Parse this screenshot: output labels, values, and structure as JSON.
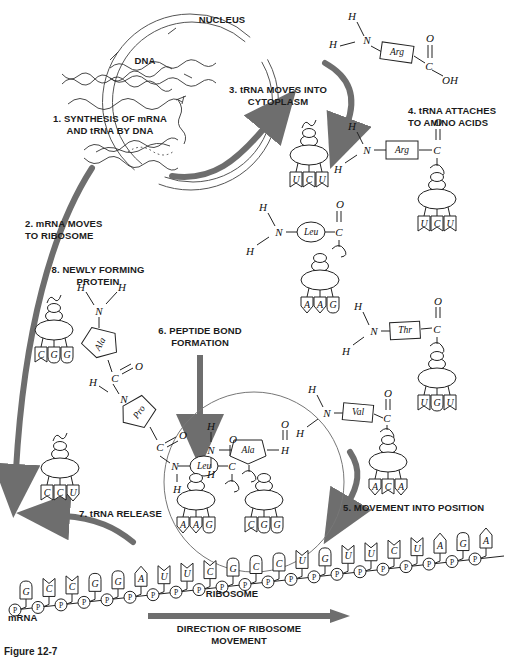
{
  "figure": {
    "caption": "Figure 12-7",
    "title_nucleus": "NUCLEUS",
    "label_dna": "DNA",
    "label_ribosome": "RIBOSOME",
    "label_mrna": "mRNA"
  },
  "steps": [
    {
      "id": 1,
      "text": "1. SYNTHESIS OF mRNA\nAND tRNA BY DNA"
    },
    {
      "id": 2,
      "text": "2. mRNA MOVES\nTO RIBOSOME"
    },
    {
      "id": 3,
      "text": "3. tRNA MOVES INTO\nCYTOPLASM"
    },
    {
      "id": 4,
      "text": "4. tRNA ATTACHES\nTO AMINO ACIDS"
    },
    {
      "id": 5,
      "text": "5. MOVEMENT INTO POSITION"
    },
    {
      "id": 6,
      "text": "6. PEPTIDE BOND\nFORMATION"
    },
    {
      "id": 7,
      "text": "7. tRNA RELEASE"
    },
    {
      "id": 8,
      "text": "8. NEWLY FORMING\nPROTEIN"
    }
  ],
  "direction_label": "DIRECTION OF RIBOSOME\nMOVEMENT",
  "amino_acids": {
    "arg": "Arg",
    "leu": "Leu",
    "thr": "Thr",
    "val": "Val",
    "ala": "Ala",
    "pro": "Pro"
  },
  "atoms": {
    "h": "H",
    "n": "N",
    "c": "C",
    "o": "O",
    "oh": "OH",
    "p": "P"
  },
  "trna_anticodons": {
    "free_cytoplasm": [
      "U",
      "C",
      "U"
    ],
    "arg_charged": [
      "U",
      "C",
      "U"
    ],
    "leu_charged": [
      "A",
      "A",
      "G"
    ],
    "thr_charged": [
      "U",
      "G",
      "U"
    ],
    "val_charged": [
      "A",
      "C",
      "A"
    ],
    "ribosome_site_p": [
      "A",
      "A",
      "G"
    ],
    "ribosome_site_a": [
      "C",
      "G",
      "G"
    ],
    "released": [
      "C",
      "C",
      "U"
    ],
    "protein_chain": [
      "C",
      "G",
      "G"
    ]
  },
  "mrna_sequence": [
    "G",
    "C",
    "C",
    "G",
    "G",
    "A",
    "U",
    "U",
    "C",
    "G",
    "C",
    "C",
    "U",
    "G",
    "U",
    "U",
    "C",
    "U",
    "A",
    "G",
    "A"
  ],
  "colors": {
    "ink": "#1b1b1b",
    "line": "#222222",
    "arrow_gray": "#6e6e6e",
    "arrow_dark": "#555555"
  }
}
